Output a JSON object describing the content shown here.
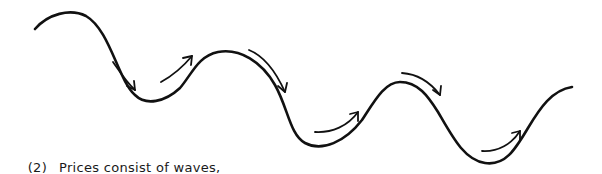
{
  "figure": {
    "number": "(2)",
    "caption": "Prices consist of waves",
    "caption_trailing": ",",
    "stroke_color": "#111111",
    "background": "#ffffff",
    "wave_path": "M35,29 C48,14 70,8 86,16 C110,30 118,80 135,95 C146,106 165,102 180,88 C192,74 198,56 218,52 C240,48 262,62 275,85 C288,108 290,135 305,143 C322,152 345,142 362,120 C375,100 385,82 400,82 C418,82 428,96 438,112 C452,136 464,160 485,163 C505,166 515,150 528,128 C540,108 552,90 572,87",
    "arrows": [
      {
        "id": "arrow-down-1",
        "direction": "down",
        "path": "M113,62 C120,72 126,82 135,90",
        "head": "M127,86 L135,90 L134,81"
      },
      {
        "id": "arrow-up-1",
        "direction": "up",
        "path": "M161,82 C172,76 182,68 192,56",
        "head": "M183,58 L192,56 L191,65"
      },
      {
        "id": "arrow-down-2",
        "direction": "down",
        "path": "M249,50 C264,56 276,72 285,92",
        "head": "M278,86 L285,92 L287,83"
      },
      {
        "id": "arrow-up-2",
        "direction": "up",
        "path": "M315,132 C332,133 348,126 358,112",
        "head": "M350,114 L358,112 L358,121"
      },
      {
        "id": "arrow-down-3",
        "direction": "down",
        "path": "M402,73 C418,74 430,82 440,95",
        "head": "M433,90 L440,95 L441,86"
      },
      {
        "id": "arrow-up-3",
        "direction": "up",
        "path": "M482,151 C498,152 512,144 520,131",
        "head": "M512,133 L520,131 L520,140"
      }
    ]
  }
}
